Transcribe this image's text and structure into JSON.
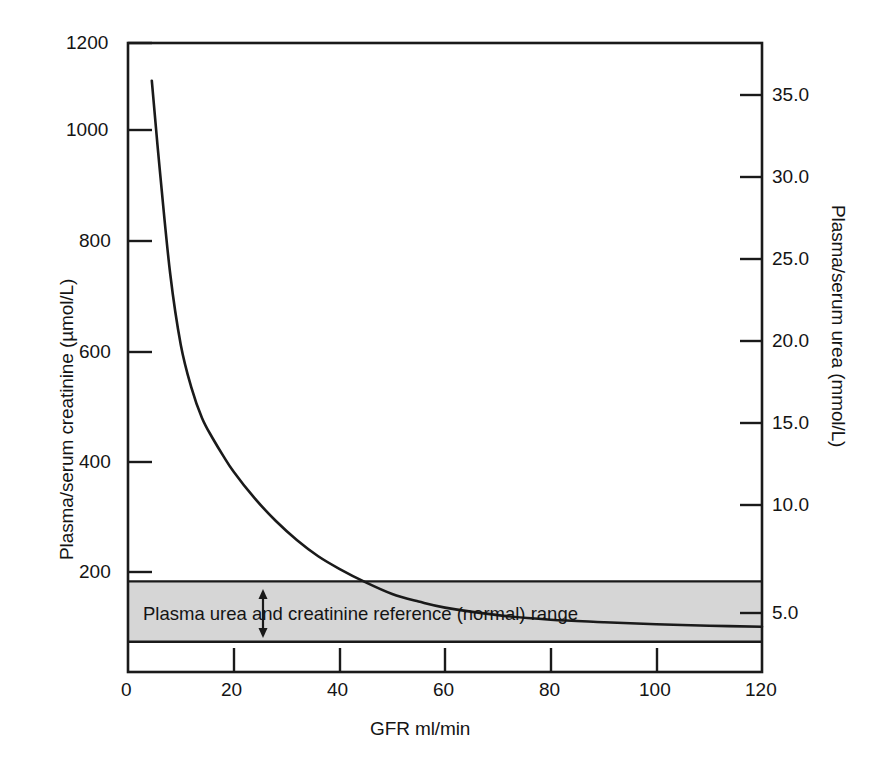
{
  "chart_data": {
    "type": "line",
    "title": "",
    "xlabel": "GFR ml/min",
    "ylabel": "Plasma/serum creatinine (µmol/L)",
    "y2label": "Plasma/serum urea (mmol/L)",
    "xlim": [
      0,
      120
    ],
    "ylim": [
      0,
      1250
    ],
    "y2lim": [
      0,
      39.0
    ],
    "grid": false,
    "legend": null,
    "xticks": [
      0,
      20,
      40,
      60,
      80,
      100,
      120
    ],
    "xticklabels": [
      "0",
      "20",
      "40",
      "60",
      "80",
      "100",
      "120"
    ],
    "yticks": [
      200,
      400,
      600,
      800,
      1000,
      1200
    ],
    "yticklabels": [
      "200",
      "400",
      "600",
      "800",
      "1000",
      "1200"
    ],
    "y2ticks": [
      5.0,
      10.0,
      15.0,
      20.0,
      25.0,
      30.0,
      35.0
    ],
    "y2ticklabels": [
      "5.0",
      "10.0",
      "15.0",
      "20.0",
      "25.0",
      "30.0",
      "35.0"
    ],
    "series": [
      {
        "name": "Plasma/serum creatinine vs GFR",
        "x": [
          4.5,
          6,
          8,
          10,
          12,
          14,
          16,
          18,
          20,
          24,
          28,
          32,
          36,
          40,
          45,
          50,
          55,
          60,
          70,
          80,
          90,
          100,
          110,
          120
        ],
        "values": [
          1175,
          1000,
          790,
          650,
          565,
          505,
          465,
          430,
          398,
          345,
          300,
          262,
          230,
          205,
          178,
          155,
          140,
          128,
          113,
          104,
          99,
          95,
          92,
          90
        ]
      }
    ],
    "annotations": [
      {
        "name": "reference-range-band",
        "label": "Plasma urea and creatinine reference (normal) range",
        "y_low_creatinine": 60,
        "y_high_creatinine": 180,
        "y_low_urea": 2.0,
        "y_high_urea": 5.5,
        "fill": "#d6d6d6",
        "arrow": "double-headed vertical arrow at GFR ≈ 24"
      }
    ],
    "colors": {
      "curve": "#1a1a1a",
      "axis": "#1a1a1a",
      "band_fill": "#d6d6d6",
      "background": "#ffffff"
    }
  },
  "axes": {
    "left_title": "Plasma/serum creatinine (µmol/L)",
    "right_title": "Plasma/serum urea (mmol/L)",
    "bottom_title": "GFR ml/min"
  },
  "band": {
    "text": "Plasma urea and creatinine reference (normal) range"
  }
}
